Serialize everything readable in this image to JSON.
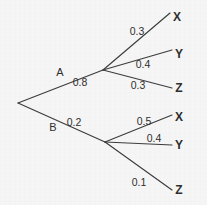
{
  "diagram": {
    "type": "probability-tree",
    "background_color": "#f7f7f7",
    "line_color": "#3c3c3c",
    "text_color": "#2e2e2e",
    "root": {
      "x": 18,
      "y": 103
    },
    "branches": [
      {
        "id": "a",
        "label": "A",
        "probability": "0.8",
        "label_x": 60,
        "label_y": 76,
        "prob_x": 80,
        "prob_y": 86,
        "node_x": 103,
        "node_y": 70,
        "leaves": [
          {
            "id": "a-x",
            "label": "X",
            "probability": "0.3",
            "prob_x": 137,
            "prob_y": 35,
            "leaf_x": 177,
            "leaf_y": 21,
            "end_x": 170,
            "end_y": 13
          },
          {
            "id": "a-y",
            "label": "Y",
            "probability": "0.4",
            "prob_x": 143,
            "prob_y": 68,
            "leaf_x": 179,
            "leaf_y": 58,
            "end_x": 172,
            "end_y": 50
          },
          {
            "id": "a-z",
            "label": "Z",
            "probability": "0.3",
            "prob_x": 138,
            "prob_y": 89,
            "leaf_x": 179,
            "leaf_y": 92,
            "end_x": 172,
            "end_y": 88
          }
        ]
      },
      {
        "id": "b",
        "label": "B",
        "probability": "0.2",
        "label_x": 53,
        "label_y": 131,
        "prob_x": 74,
        "prob_y": 126,
        "node_x": 105,
        "node_y": 142,
        "leaves": [
          {
            "id": "b-x",
            "label": "X",
            "probability": "0.5",
            "prob_x": 144,
            "prob_y": 125,
            "leaf_x": 179,
            "leaf_y": 121,
            "end_x": 172,
            "end_y": 115
          },
          {
            "id": "b-y",
            "label": "Y",
            "probability": "0.4",
            "prob_x": 154,
            "prob_y": 142,
            "leaf_x": 179,
            "leaf_y": 149,
            "end_x": 172,
            "end_y": 145
          },
          {
            "id": "b-z",
            "label": "Z",
            "probability": "0.1",
            "prob_x": 139,
            "prob_y": 186,
            "leaf_x": 179,
            "leaf_y": 194,
            "end_x": 172,
            "end_y": 190
          }
        ]
      }
    ]
  }
}
